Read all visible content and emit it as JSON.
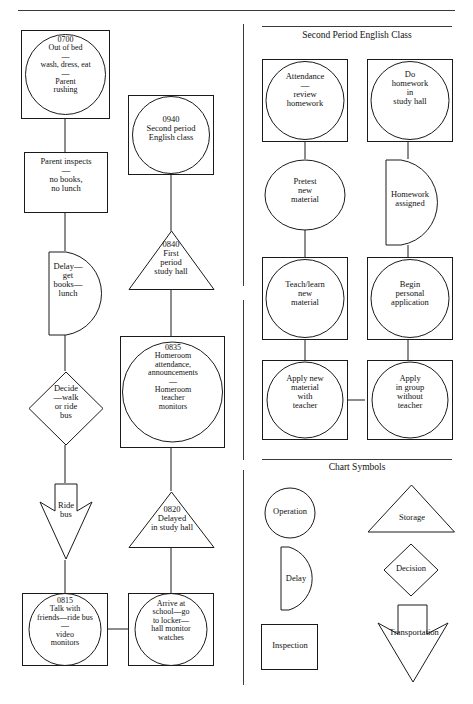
{
  "document": {
    "type": "process-flow-chart",
    "top_rule": true
  },
  "left_chart": {
    "nodes": [
      {
        "id": "n1",
        "shape": "inspection-operation",
        "symbol": "operation-in-inspection",
        "text": "0700\nOut of bed\n—\nwash, dress, eat\n—\nParent\nrushing"
      },
      {
        "id": "n2",
        "shape": "inspection",
        "symbol": "inspection",
        "text": "Parent inspects\n—\nno books,\nno lunch"
      },
      {
        "id": "n3",
        "shape": "delay",
        "symbol": "delay",
        "text": "Delay—\nget\nbooks—\nlunch"
      },
      {
        "id": "n4",
        "shape": "decision",
        "symbol": "decision",
        "text": "Decide\n—walk\nor ride\nbus"
      },
      {
        "id": "n5",
        "shape": "transportation",
        "symbol": "transportation",
        "text": "Ride\nbus"
      },
      {
        "id": "n6",
        "shape": "inspection-operation",
        "symbol": "operation-in-inspection",
        "text": "0815\nTalk with\nfriends—ride bus\n—\nvideo\nmonitors"
      }
    ]
  },
  "middle_chart": {
    "nodes": [
      {
        "id": "m1",
        "shape": "inspection-operation",
        "symbol": "operation-in-inspection",
        "text": "0940\nSecond period\nEnglish class"
      },
      {
        "id": "m2",
        "shape": "storage",
        "symbol": "storage",
        "text": "0840\nFirst\nperiod\nstudy hall"
      },
      {
        "id": "m3",
        "shape": "inspection-operation",
        "symbol": "operation-in-inspection",
        "text": "0835\nHomeroom\nattendance,\nannouncements\n—\nHomeroom\nteacher\nmonitors"
      },
      {
        "id": "m4",
        "shape": "storage",
        "symbol": "storage",
        "text": "0820\nDelayed\nin study hall"
      },
      {
        "id": "m5",
        "shape": "inspection-operation",
        "symbol": "operation-in-inspection",
        "text": "Arrive at\nschool—go\nto locker—\nhall monitor\nwatches"
      }
    ]
  },
  "right_panel": {
    "title": "Second Period English Class",
    "nodes": [
      {
        "id": "r1",
        "shape": "inspection-operation",
        "symbol": "operation-in-inspection",
        "text": "Attendance\n—\nreview\nhomework"
      },
      {
        "id": "r2",
        "shape": "inspection-operation",
        "symbol": "operation-in-inspection",
        "text": "Do\nhomework\nin\nstudy hall"
      },
      {
        "id": "r3",
        "shape": "operation",
        "symbol": "operation",
        "text": "Pretest\nnew\nmaterial"
      },
      {
        "id": "r4",
        "shape": "delay",
        "symbol": "delay",
        "text": "Homework\nassigned"
      },
      {
        "id": "r5",
        "shape": "inspection-operation",
        "symbol": "operation-in-inspection",
        "text": "Teach/learn\nnew\nmaterial"
      },
      {
        "id": "r6",
        "shape": "inspection-operation",
        "symbol": "operation-in-inspection",
        "text": "Begin\npersonal\napplication"
      },
      {
        "id": "r7",
        "shape": "inspection-operation",
        "symbol": "operation-in-inspection",
        "text": "Apply new\nmaterial\nwith\nteacher"
      },
      {
        "id": "r8",
        "shape": "inspection-operation",
        "symbol": "operation-in-inspection",
        "text": "Apply\nin group\nwithout\nteacher"
      }
    ]
  },
  "legend": {
    "title": "Chart Symbols",
    "items": [
      {
        "id": "l1",
        "shape": "operation",
        "label": "Operation"
      },
      {
        "id": "l2",
        "shape": "storage",
        "label": "Storage"
      },
      {
        "id": "l3",
        "shape": "delay",
        "label": "Delay"
      },
      {
        "id": "l4",
        "shape": "decision",
        "label": "Decision"
      },
      {
        "id": "l5",
        "shape": "inspection",
        "label": "Inspection"
      },
      {
        "id": "l6",
        "shape": "transportation",
        "label": "Transportation"
      }
    ]
  },
  "style": {
    "stroke": "#1a1a1a",
    "rule_color": "#3a3a3a",
    "background": "#ffffff"
  }
}
